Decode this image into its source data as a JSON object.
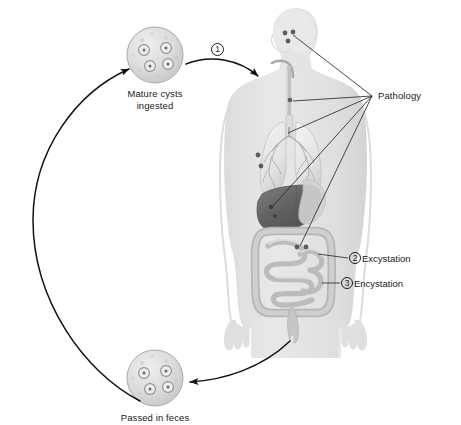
{
  "figure": {
    "background_color": "#ffffff",
    "line_color": "#1a1a1a",
    "body_color": "#e2e2e2",
    "organ_color": "#c9c9c9",
    "liver_color": "#6a6a6a",
    "lesion_color": "#5a5a5a"
  },
  "labels": {
    "mature_cysts": "Mature cysts\ningested",
    "mature_cysts_line1": "Mature cysts",
    "mature_cysts_line2": "ingested",
    "passed_in_feces": "Passed in feces",
    "pathology": "Pathology",
    "excystation": "Excystation",
    "encystation": "Encystation"
  },
  "steps": [
    {
      "number": "1",
      "label": "",
      "description": "Mature cysts ingested into mouth"
    },
    {
      "number": "2",
      "label": "Excystation",
      "description": "Excystation in the intestine"
    },
    {
      "number": "3",
      "label": "Encystation",
      "description": "Encystation in the intestine"
    }
  ],
  "cysts": [
    {
      "name": "mature-cysts-ingested",
      "caption_line1": "Mature cysts",
      "caption_line2": "ingested",
      "nuclei_count": 4,
      "cx": 155,
      "cy": 55,
      "r": 28
    },
    {
      "name": "passed-in-feces",
      "caption_line1": "Passed in feces",
      "caption_line2": "",
      "nuclei_count": 4,
      "cx": 155,
      "cy": 378,
      "r": 28
    }
  ],
  "pathology_sites": [
    {
      "name": "brain",
      "dots": 3
    },
    {
      "name": "esophagus",
      "dots": 1
    },
    {
      "name": "lung",
      "dots": 2
    },
    {
      "name": "liver",
      "dots": 2
    },
    {
      "name": "intestine",
      "dots": 2
    }
  ],
  "anatomy": [
    "head",
    "neck",
    "torso",
    "arms",
    "hands",
    "legs",
    "esophagus",
    "lungs",
    "bronchi",
    "liver",
    "stomach",
    "small-intestine",
    "large-intestine",
    "rectum"
  ]
}
